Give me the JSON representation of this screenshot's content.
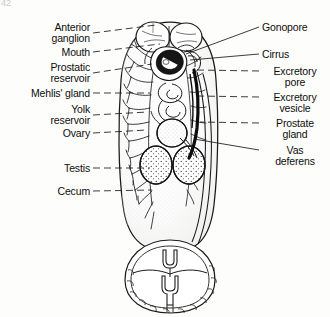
{
  "figure": {
    "corner_mark": "42",
    "background_color": "#fdfdfb",
    "ink_color": "#111111"
  },
  "labels_left": [
    {
      "id": "anterior-ganglion",
      "text": "Anterior\nganglion",
      "x": 18,
      "y": 22,
      "w": 72,
      "leader": {
        "x1": 93,
        "y1": 33,
        "x2": 156,
        "y2": 25
      }
    },
    {
      "id": "mouth",
      "text": "Mouth",
      "x": 28,
      "y": 47,
      "w": 62,
      "leader": {
        "x1": 93,
        "y1": 52,
        "x2": 160,
        "y2": 44
      }
    },
    {
      "id": "prostatic-reservoir",
      "text": "Prostatic\nreservoir",
      "x": 14,
      "y": 62,
      "w": 76,
      "leader": {
        "x1": 93,
        "y1": 73,
        "x2": 152,
        "y2": 64
      }
    },
    {
      "id": "mehlis-gland",
      "text": "Mehlis' gland",
      "x": 8,
      "y": 88,
      "w": 82,
      "leader": {
        "x1": 93,
        "y1": 93,
        "x2": 150,
        "y2": 93
      }
    },
    {
      "id": "yolk-reservoir",
      "text": "Yolk\nreservoir",
      "x": 22,
      "y": 104,
      "w": 68,
      "leader": {
        "x1": 93,
        "y1": 115,
        "x2": 148,
        "y2": 112
      }
    },
    {
      "id": "ovary",
      "text": "Ovary",
      "x": 34,
      "y": 128,
      "w": 56,
      "leader": {
        "x1": 93,
        "y1": 133,
        "x2": 147,
        "y2": 130
      }
    },
    {
      "id": "testis",
      "text": "Testis",
      "x": 32,
      "y": 163,
      "w": 58,
      "leader": {
        "x1": 93,
        "y1": 168,
        "x2": 150,
        "y2": 168
      }
    },
    {
      "id": "cecum",
      "text": "Cecum",
      "x": 28,
      "y": 186,
      "w": 62,
      "leader": {
        "x1": 93,
        "y1": 191,
        "x2": 152,
        "y2": 190
      }
    }
  ],
  "labels_right": [
    {
      "id": "gonopore",
      "text": "Gonopore",
      "x": 262,
      "y": 22,
      "leader": {
        "x1": 259,
        "y1": 27,
        "x2": 186,
        "y2": 54
      }
    },
    {
      "id": "cirrus",
      "text": "Cirrus",
      "x": 262,
      "y": 49,
      "leader": {
        "x1": 259,
        "y1": 54,
        "x2": 188,
        "y2": 58
      }
    },
    {
      "id": "excretory-pore",
      "text": "Excretory\npore",
      "x": 262,
      "y": 66,
      "leader": {
        "x1": 259,
        "y1": 71,
        "x2": 197,
        "y2": 70
      }
    },
    {
      "id": "excretory-vesicle",
      "text": "Excretory\nvesicle",
      "x": 262,
      "y": 92,
      "leader": {
        "x1": 259,
        "y1": 97,
        "x2": 198,
        "y2": 96
      }
    },
    {
      "id": "prostate-gland",
      "text": "Prostate\ngland",
      "x": 262,
      "y": 118,
      "leader": {
        "x1": 259,
        "y1": 123,
        "x2": 200,
        "y2": 122
      }
    },
    {
      "id": "vas-deferens",
      "text": "Vas\ndeferens",
      "x": 262,
      "y": 145,
      "leader": {
        "x1": 259,
        "y1": 150,
        "x2": 194,
        "y2": 139
      }
    }
  ],
  "structures": [
    {
      "id": "body-outline",
      "name": "body outline"
    },
    {
      "id": "oral-sucker",
      "name": "oral sucker"
    },
    {
      "id": "ventral-sucker",
      "name": "ventral sucker"
    },
    {
      "id": "cecum-left",
      "name": "branched intestinal cecum"
    },
    {
      "id": "cecum-right",
      "name": "branched intestinal cecum"
    },
    {
      "id": "ovary-organ",
      "name": "ovary"
    },
    {
      "id": "testis-left",
      "name": "left testis"
    },
    {
      "id": "testis-right",
      "name": "right testis"
    },
    {
      "id": "excretory-duct",
      "name": "excretory duct"
    },
    {
      "id": "haptor",
      "name": "posterior haptor with anchors"
    }
  ]
}
